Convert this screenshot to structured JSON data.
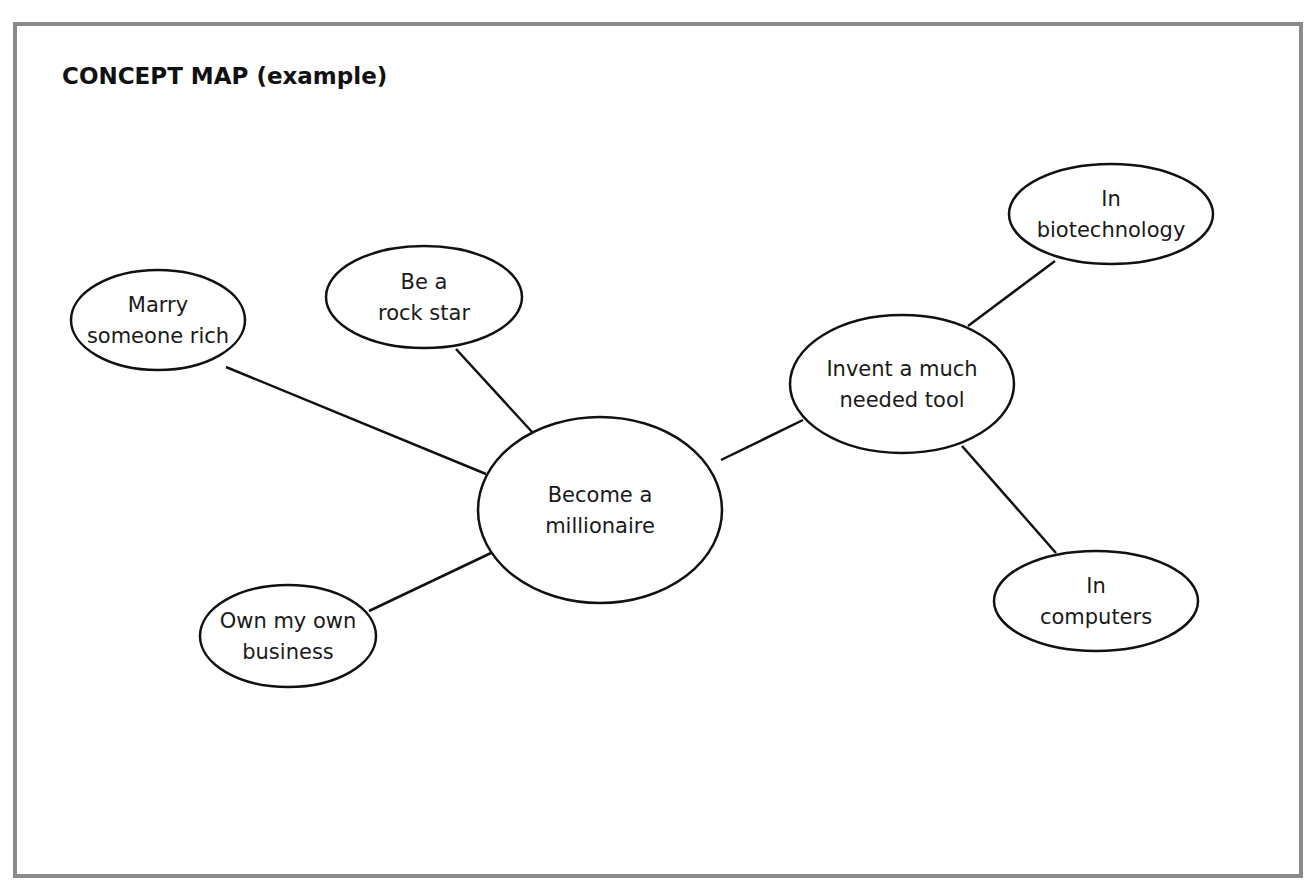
{
  "title": "CONCEPT MAP (example)",
  "colors": {
    "frame_border": "#8a8a8a",
    "stroke": "#111111",
    "text": "#1a1a1a",
    "background": "#ffffff"
  },
  "nodes": [
    {
      "id": "center",
      "lines": [
        "Become a",
        "millionaire"
      ],
      "cx": 600,
      "cy": 510,
      "rx": 122,
      "ry": 93,
      "central": true
    },
    {
      "id": "marry",
      "lines": [
        "Marry",
        "someone rich"
      ],
      "cx": 158,
      "cy": 320,
      "rx": 87,
      "ry": 50
    },
    {
      "id": "rock",
      "lines": [
        "Be a",
        "rock star"
      ],
      "cx": 424,
      "cy": 297,
      "rx": 98,
      "ry": 51
    },
    {
      "id": "business",
      "lines": [
        "Own my own",
        "business"
      ],
      "cx": 288,
      "cy": 636,
      "rx": 88,
      "ry": 51
    },
    {
      "id": "invent",
      "lines": [
        "Invent a much",
        "needed tool"
      ],
      "cx": 902,
      "cy": 384,
      "rx": 112,
      "ry": 69
    },
    {
      "id": "biotech",
      "lines": [
        "In",
        "biotechnology"
      ],
      "cx": 1111,
      "cy": 214,
      "rx": 102,
      "ry": 50
    },
    {
      "id": "computers",
      "lines": [
        "In",
        "computers"
      ],
      "cx": 1096,
      "cy": 601,
      "rx": 102,
      "ry": 50
    }
  ],
  "edges": [
    {
      "from": "marry",
      "to": "center",
      "x1": 226,
      "y1": 367,
      "x2": 486,
      "y2": 474
    },
    {
      "from": "rock",
      "to": "center",
      "x1": 456,
      "y1": 349,
      "x2": 533,
      "y2": 433
    },
    {
      "from": "business",
      "to": "center",
      "x1": 369,
      "y1": 611,
      "x2": 491,
      "y2": 553
    },
    {
      "from": "center",
      "to": "invent",
      "x1": 721,
      "y1": 460,
      "x2": 803,
      "y2": 420
    },
    {
      "from": "invent",
      "to": "biotech",
      "x1": 968,
      "y1": 326,
      "x2": 1055,
      "y2": 261
    },
    {
      "from": "invent",
      "to": "computers",
      "x1": 962,
      "y1": 446,
      "x2": 1056,
      "y2": 553
    }
  ]
}
